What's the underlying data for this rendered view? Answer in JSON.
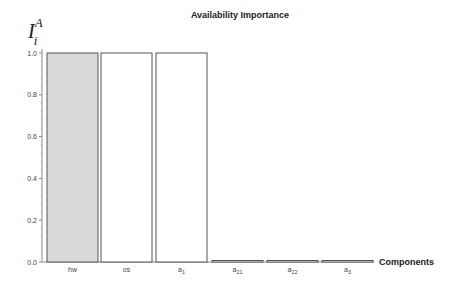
{
  "chart_data": {
    "type": "bar",
    "title": "Availability Importance",
    "xlabel": "Components",
    "ylabel": "I_i^A",
    "ylim": [
      0,
      1.0
    ],
    "yticks": [
      "0.0",
      "0.2",
      "0.4",
      "0.6",
      "0.8",
      "1.0"
    ],
    "categories": [
      "hw",
      "os",
      "a1",
      "a21",
      "a22",
      "a3"
    ],
    "values": [
      1.0,
      1.0,
      1.0,
      0.0,
      0.0,
      0.0
    ],
    "grid": false,
    "highlight_color": "#d9d9d9",
    "bar_color": "#ffffff"
  }
}
